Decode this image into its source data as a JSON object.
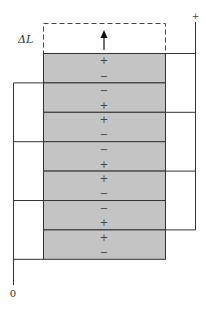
{
  "diagram": {
    "elongation_label": "ΔL",
    "terminal_positive_label": "+",
    "terminal_ground_label": "0",
    "colors": {
      "layer_fill": "#c4c4c4",
      "lines": "#333333",
      "background": "#ffffff"
    },
    "layers": [
      {
        "top_sign": "+",
        "bottom_sign": "−"
      },
      {
        "top_sign": "−",
        "bottom_sign": "+"
      },
      {
        "top_sign": "+",
        "bottom_sign": "−"
      },
      {
        "top_sign": "−",
        "bottom_sign": "+"
      },
      {
        "top_sign": "+",
        "bottom_sign": "−"
      },
      {
        "top_sign": "−",
        "bottom_sign": "+"
      },
      {
        "top_sign": "+",
        "bottom_sign": "−"
      }
    ]
  }
}
